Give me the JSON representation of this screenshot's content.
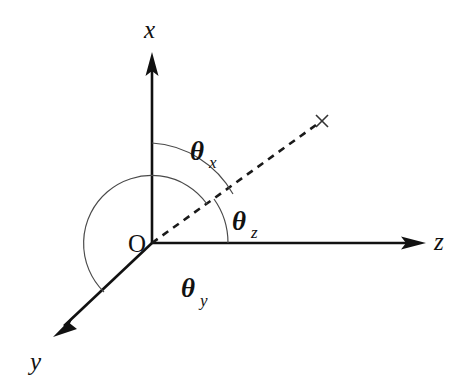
{
  "figure": {
    "background_color": "#ffffff",
    "line_color": "#111111",
    "arc_color": "#4a4a4a",
    "width": 464,
    "height": 382
  },
  "origin": {
    "label": "O",
    "x": 152,
    "y": 243
  },
  "axes": [
    {
      "name": "x-axis",
      "label": "x",
      "label_x": 152,
      "label_y": 30,
      "from_x": 152,
      "from_y": 243,
      "to_x": 152,
      "to_y": 55,
      "arrow": true,
      "style": "solid"
    },
    {
      "name": "z-axis",
      "label": "z",
      "label_x": 441,
      "label_y": 240,
      "from_x": 152,
      "from_y": 243,
      "to_x": 424,
      "to_y": 243,
      "arrow": true,
      "style": "solid"
    },
    {
      "name": "y-axis",
      "label": "y",
      "label_x": 38,
      "label_y": 362,
      "from_x": 152,
      "from_y": 243,
      "to_x": 55,
      "to_y": 335,
      "arrow": true,
      "style": "solid"
    }
  ],
  "vector": {
    "name": "direction-vector",
    "style": "dashed",
    "from_x": 152,
    "from_y": 243,
    "to_x": 318,
    "to_y": 124,
    "endpoint_marker": "cross-marker",
    "endpoint_marker_x": 322,
    "endpoint_marker_y": 121,
    "endpoint_marker_size": 9
  },
  "angles": [
    {
      "name": "theta-x",
      "symbol": "θ",
      "subscript": "x",
      "measured_from": "x-axis",
      "measured_to": "direction-vector",
      "label_x": 198,
      "label_y": 158,
      "arc_radius": 100,
      "arc_start_deg": 90,
      "arc_end_deg": 35.6
    },
    {
      "name": "theta-z",
      "symbol": "θ",
      "subscript": "z",
      "measured_from": "direction-vector",
      "measured_to": "z-axis",
      "label_x": 237,
      "label_y": 228,
      "arc_radius": 76,
      "arc_start_deg": 35.6,
      "arc_end_deg": 0
    },
    {
      "name": "theta-y",
      "symbol": "θ",
      "subscript": "y",
      "measured_from": "direction-vector",
      "measured_to": "y-axis",
      "label_x": 188,
      "label_y": 296,
      "arc_radius": 68,
      "arc_start_deg": 35.6,
      "arc_end_deg": -136.5
    }
  ]
}
